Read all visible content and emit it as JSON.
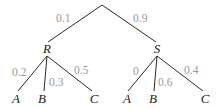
{
  "diagram": {
    "type": "probability-tree",
    "root": {
      "children": [
        {
          "id": "R",
          "label": "R",
          "probability": "0.1",
          "children": [
            {
              "label": "A",
              "probability": "0.2"
            },
            {
              "label": "B",
              "probability": "0.3"
            },
            {
              "label": "C",
              "probability": "0.5"
            }
          ]
        },
        {
          "id": "S",
          "label": "S",
          "probability": "0.9",
          "children": [
            {
              "label": "A",
              "probability": "0"
            },
            {
              "label": "B",
              "probability": "0.6"
            },
            {
              "label": "C",
              "probability": "0.4"
            }
          ]
        }
      ]
    }
  },
  "colors": {
    "edge": "#2a2a2a",
    "node_label": "#1a1a1a",
    "probability_label": "#9a9a9a",
    "background": "#ffffff"
  }
}
